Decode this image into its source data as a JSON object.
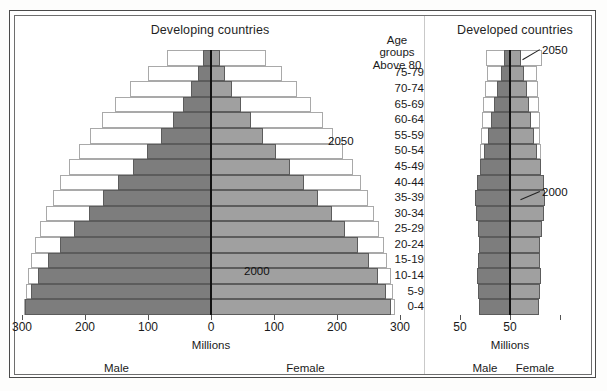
{
  "figure": {
    "panels": [
      {
        "id": "developing",
        "title": "Developing countries",
        "axis_unit": "Millions",
        "male_label": "Male",
        "female_label": "Female",
        "ticks": [
          "300",
          "200",
          "100",
          "0",
          "100",
          "200",
          "300"
        ],
        "annotations": [
          {
            "label": "2050"
          },
          {
            "label": "2000"
          }
        ]
      },
      {
        "id": "developed",
        "title": "Developed countries",
        "axis_unit": "Millions",
        "male_label": "Male",
        "female_label": "Female",
        "ticks": [
          "50",
          "50"
        ],
        "annotations": [
          {
            "label": "2050"
          },
          {
            "label": "2000"
          }
        ]
      }
    ],
    "age_axis": {
      "heading": "Age groups",
      "top_group": "Above 80",
      "groups": [
        "75-79",
        "70-74",
        "65-69",
        "60-64",
        "55-59",
        "50-54",
        "45-49",
        "40-44",
        "35-39",
        "30-34",
        "25-29",
        "20-24",
        "15-19",
        "10-14",
        "5-9",
        "0-4"
      ]
    },
    "colors": {
      "male_fill": "#7d7d7d",
      "female_fill": "#a0a0a0",
      "outline": "#a9a9a9",
      "center_axis": "#111111",
      "frame": "#4a4a4a"
    }
  },
  "chart_data": {
    "type": "bar",
    "subtype": "population-pyramid",
    "xlabel": "Millions",
    "ylabel": "Age groups",
    "categories": [
      "Above 80",
      "75-79",
      "70-74",
      "65-69",
      "60-64",
      "55-59",
      "50-54",
      "45-49",
      "40-44",
      "35-39",
      "30-34",
      "25-29",
      "20-24",
      "15-19",
      "10-14",
      "5-9",
      "0-4"
    ],
    "panels": [
      {
        "name": "Developing countries",
        "xlim": [
          -300,
          300
        ],
        "xticks": [
          -300,
          -200,
          -100,
          0,
          100,
          200,
          300
        ],
        "series": [
          {
            "name": "2000 Male",
            "side": "male",
            "year": 2000,
            "style": "filled",
            "values": [
              12,
              20,
              31,
              45,
              61,
              80,
              101,
              124,
              148,
              171,
              194,
              217,
              239,
              258,
              274,
              286,
              295
            ]
          },
          {
            "name": "2000 Female",
            "side": "female",
            "year": 2000,
            "style": "filled",
            "values": [
              14,
              22,
              33,
              47,
              63,
              82,
              103,
              125,
              148,
              170,
              192,
              213,
              233,
              251,
              265,
              277,
              286
            ]
          },
          {
            "name": "2050 Male",
            "side": "male",
            "year": 2050,
            "style": "outline",
            "values": [
              70,
              100,
              128,
              152,
              173,
              192,
              209,
              225,
              239,
              251,
              262,
              271,
              279,
              285,
              290,
              294,
              297
            ]
          },
          {
            "name": "2050 Female",
            "side": "female",
            "year": 2050,
            "style": "outline",
            "values": [
              88,
              112,
              137,
              158,
              177,
              194,
              210,
              225,
              238,
              249,
              259,
              267,
              274,
              280,
              285,
              289,
              292
            ]
          }
        ]
      },
      {
        "name": "Developed countries",
        "xlim": [
          -50,
          50
        ],
        "xticks": [
          -50,
          0,
          50
        ],
        "series": [
          {
            "name": "2000 Male",
            "side": "male",
            "year": 2000,
            "style": "filled",
            "values": [
              6,
              9,
              13,
              16,
              19,
              22,
              26,
              30,
              33,
              35,
              34,
              32,
              31,
              32,
              33,
              32,
              31
            ]
          },
          {
            "name": "2000 Female",
            "side": "female",
            "year": 2000,
            "style": "filled",
            "values": [
              11,
              14,
              17,
              19,
              21,
              24,
              27,
              31,
              34,
              35,
              34,
              32,
              30,
              30,
              31,
              30,
              29
            ]
          },
          {
            "name": "2050 Male",
            "side": "male",
            "year": 2050,
            "style": "outline",
            "values": [
              24,
              23,
              25,
              27,
              28,
              29,
              30,
              30,
              30,
              30,
              30,
              30,
              29,
              29,
              29,
              29,
              29
            ]
          },
          {
            "name": "2050 Female",
            "side": "female",
            "year": 2050,
            "style": "outline",
            "values": [
              32,
              27,
              28,
              29,
              30,
              30,
              31,
              31,
              31,
              30,
              30,
              29,
              29,
              28,
              28,
              28,
              28
            ]
          }
        ]
      }
    ]
  }
}
